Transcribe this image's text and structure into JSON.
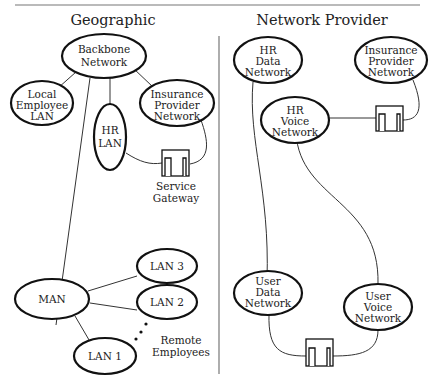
{
  "panels": {
    "left": {
      "title": "Geographic",
      "nodes": {
        "backbone": [
          "Backbone",
          "Network"
        ],
        "local_lan": [
          "Local",
          "Employee",
          "LAN"
        ],
        "hr_lan": [
          "HR",
          "LAN"
        ],
        "insurance": [
          "Insurance",
          "Provider",
          "Network"
        ],
        "man": [
          "MAN"
        ],
        "lan3": [
          "LAN 3"
        ],
        "lan2": [
          "LAN 2"
        ],
        "lan1": [
          "LAN 1"
        ]
      },
      "gateway_label": [
        "Service",
        "Gateway"
      ],
      "remote_label": [
        "Remote",
        "Employees"
      ]
    },
    "right": {
      "title": "Network Provider",
      "nodes": {
        "hr_data": [
          "HR",
          "Data",
          "Network"
        ],
        "insurance": [
          "Insurance",
          "Provider",
          "Network"
        ],
        "hr_voice": [
          "HR",
          "Voice",
          "Network"
        ],
        "user_data": [
          "User",
          "Data",
          "Network"
        ],
        "user_voice": [
          "User",
          "Voice",
          "Network"
        ]
      }
    }
  },
  "icons": {
    "gateway": "gateway-box-icon",
    "ellipsis": "vertical-dots"
  }
}
